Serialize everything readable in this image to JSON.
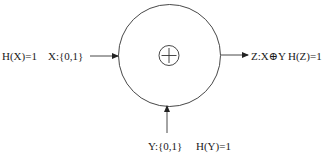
{
  "diagram": {
    "type": "xor-entropy-block",
    "operator_symbol": "⊕",
    "inputs": [
      {
        "id": "x",
        "entropy_label": "H(X)=1",
        "alphabet_label": "X:{0,1}",
        "direction": "left"
      },
      {
        "id": "y",
        "entropy_label": "H(Y)=1",
        "alphabet_label": "Y:{0,1}",
        "direction": "bottom"
      }
    ],
    "output": {
      "id": "z",
      "expression_label": "Z:X⊕Y",
      "entropy_label": "H(Z)=1",
      "direction": "right"
    },
    "colors": {
      "stroke": "#333333",
      "text": "#1a1a1a",
      "background": "#ffffff"
    }
  }
}
